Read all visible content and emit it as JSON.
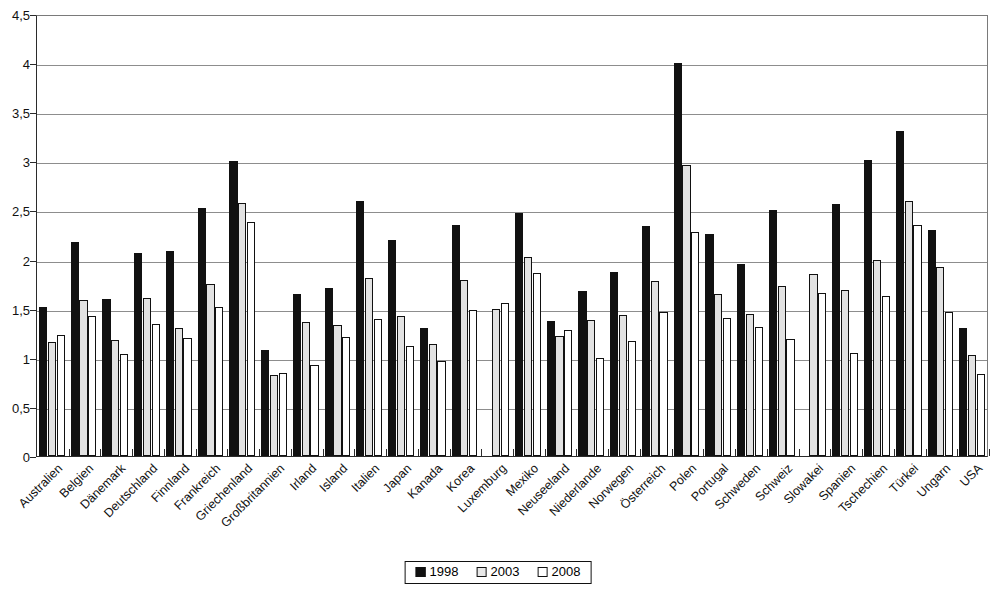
{
  "chart_data": {
    "type": "bar",
    "title": "",
    "subtitle": "",
    "xlabel": "",
    "ylabel": "",
    "ylim": [
      0,
      4.5
    ],
    "ytick_step": 0.5,
    "ytick_labels": [
      "0",
      "0,5",
      "1",
      "1,5",
      "2",
      "2,5",
      "3",
      "3,5",
      "4",
      "4,5"
    ],
    "ytick_values": [
      0,
      0.5,
      1,
      1.5,
      2,
      2.5,
      3,
      3.5,
      4,
      4.5
    ],
    "grid": true,
    "legend_position": "bottom",
    "categories": [
      "Australien",
      "Belgien",
      "Dänemark",
      "Deutschland",
      "Finnland",
      "Frankreich",
      "Griechenland",
      "Großbritannien",
      "Irland",
      "Island",
      "Italien",
      "Japan",
      "Kanada",
      "Korea",
      "Luxemburg",
      "Mexiko",
      "Neuseeland",
      "Niederlande",
      "Norwegen",
      "Österreich",
      "Polen",
      "Portugal",
      "Schweden",
      "Schweiz",
      "Slowakei",
      "Spanien",
      "Tschechien",
      "Türkei",
      "Ungarn",
      "USA"
    ],
    "series": [
      {
        "name": "1998",
        "color": "#111111",
        "values": [
          1.52,
          2.18,
          1.6,
          2.07,
          2.09,
          2.53,
          3.0,
          1.08,
          1.65,
          1.71,
          2.6,
          2.2,
          1.3,
          2.35,
          null,
          2.47,
          1.37,
          1.68,
          1.87,
          2.34,
          4.0,
          2.26,
          1.95,
          2.5,
          null,
          2.57,
          3.01,
          3.31,
          2.3,
          1.3
        ]
      },
      {
        "name": "2003",
        "color": "#e2e2e2",
        "values": [
          1.16,
          1.59,
          1.18,
          1.61,
          1.3,
          1.75,
          2.58,
          0.82,
          1.36,
          1.33,
          1.81,
          1.43,
          1.14,
          1.79,
          1.5,
          2.03,
          1.22,
          1.38,
          1.44,
          1.78,
          2.96,
          1.65,
          1.45,
          1.73,
          1.85,
          1.69,
          2.0,
          2.6,
          1.92,
          1.03
        ]
      },
      {
        "name": "2008",
        "color": "#ffffff",
        "values": [
          1.23,
          1.43,
          1.04,
          1.34,
          1.2,
          1.52,
          2.38,
          0.85,
          0.93,
          1.21,
          1.39,
          1.12,
          0.97,
          1.49,
          1.56,
          1.86,
          1.28,
          1.0,
          1.17,
          1.47,
          2.28,
          1.41,
          1.31,
          1.19,
          1.66,
          1.05,
          1.63,
          2.35,
          1.47,
          0.84
        ]
      }
    ],
    "legend_entries": [
      {
        "label": "1998",
        "color": "#111111"
      },
      {
        "label": "2003",
        "color": "#e2e2e2"
      },
      {
        "label": "2008",
        "color": "#ffffff"
      }
    ]
  }
}
